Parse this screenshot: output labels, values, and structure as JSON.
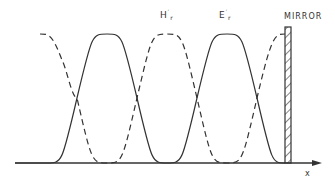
{
  "diagram": {
    "type": "standing-wave",
    "labels": {
      "h_field": "H",
      "h_sub": "r",
      "h_sup": "′",
      "e_field": "E",
      "e_sub": "r",
      "e_sup": "′",
      "mirror": "MIRROR",
      "x_axis": "x"
    },
    "legend": {
      "solid": "E field (solid)",
      "dashed": "H field (dashed)"
    },
    "colors": {
      "line": "#333333",
      "background": "#ffffff"
    }
  }
}
